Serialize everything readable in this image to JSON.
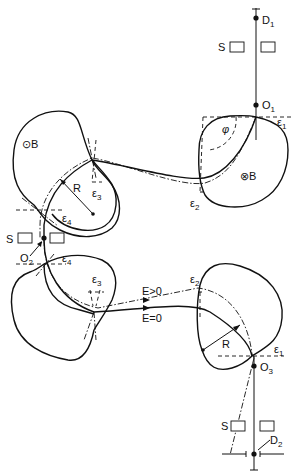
{
  "diagram": {
    "type": "magnetic-spectrometer-beam-path",
    "labels": {
      "detector_1": "D",
      "detector_1_sub": "1",
      "detector_2": "D",
      "detector_2_sub": "2",
      "origin_1": "O",
      "origin_1_sub": "1",
      "origin_2": "O",
      "origin_2_sub": "2",
      "origin_3": "O",
      "origin_3_sub": "3",
      "slit_top": "S",
      "slit_mid": "S",
      "slit_bottom": "S",
      "field_out": "B",
      "field_in": "B",
      "field_out_symbol": "⊙",
      "field_in_symbol": "⊗",
      "phi": "φ",
      "radius_upper": "R",
      "radius_lower": "R",
      "eps1_top": "ε",
      "eps1_top_sub": "1",
      "eps2_top": "ε",
      "eps2_top_sub": "2",
      "eps3_top": "ε",
      "eps3_top_sub": "3",
      "eps4_top": "ε",
      "eps4_top_sub": "4",
      "eps4_bottom": "ε",
      "eps4_bottom_sub": "4",
      "eps3_bottom": "ε",
      "eps3_bottom_sub": "3",
      "eps2_bottom": "ε",
      "eps2_bottom_sub": "2",
      "eps1_bottom": "ε",
      "eps1_bottom_sub": "1",
      "energy_positive": "E>0",
      "energy_zero": "E=0"
    },
    "legend": {
      "solid_line": "reference trajectory (E=0)",
      "dash_dot_line": "trajectory with E>0",
      "dashed_line": "pole-face / edge-angle construction"
    }
  }
}
